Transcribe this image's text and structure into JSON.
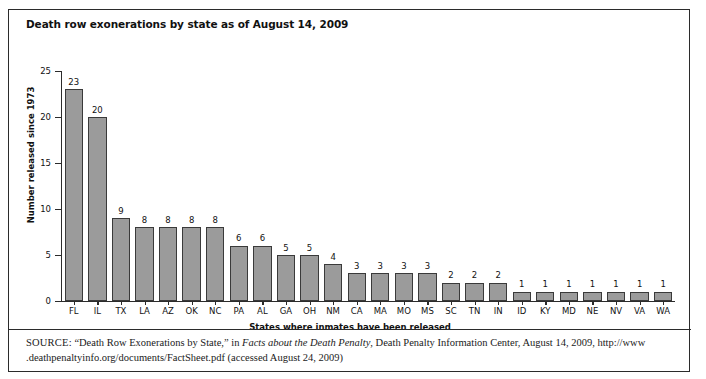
{
  "figure": {
    "title": "Death row exonerations by state as of August 14, 2009",
    "source_label": "SOURCE:",
    "source_part1": " “Death Row Exonerations by State,” in ",
    "source_italic": "Facts about the Death Penalty",
    "source_part2": ", Death Penalty Information Center, August 14, 2009, http://www .deathpenaltyinfo.org/documents/FactSheet.pdf (accessed August 24, 2009)",
    "border_color": "#2b2b2b",
    "bar_fill_color": "#9b9b9b",
    "bar_edge_color": "#3a3a3a"
  },
  "chart_data": {
    "type": "bar",
    "title": "Death row exonerations by state as of August 14, 2009",
    "xlabel": "States where inmates have been released",
    "ylabel": "Number released since 1973",
    "ylim": [
      0,
      25
    ],
    "yticks": [
      0,
      5,
      10,
      15,
      20,
      25
    ],
    "grid": false,
    "legend": "none",
    "categories": [
      "FL",
      "IL",
      "TX",
      "LA",
      "AZ",
      "OK",
      "NC",
      "PA",
      "AL",
      "GA",
      "OH",
      "NM",
      "CA",
      "MA",
      "MO",
      "MS",
      "SC",
      "TN",
      "IN",
      "ID",
      "KY",
      "MD",
      "NE",
      "NV",
      "VA",
      "WA"
    ],
    "values": [
      23,
      20,
      9,
      8,
      8,
      8,
      8,
      6,
      6,
      5,
      5,
      4,
      3,
      3,
      3,
      3,
      2,
      2,
      2,
      1,
      1,
      1,
      1,
      1,
      1,
      1
    ]
  }
}
